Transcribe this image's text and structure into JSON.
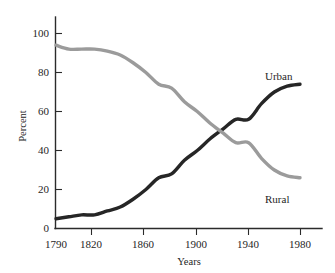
{
  "chart_data": {
    "type": "line",
    "title": "",
    "xlabel": "Years",
    "ylabel": "Percent",
    "xlim": [
      1790,
      1990
    ],
    "ylim": [
      0,
      108
    ],
    "grid": false,
    "legend_position": "inline-right",
    "xticks": [
      1790,
      1820,
      1860,
      1900,
      1940,
      1980
    ],
    "xtick_labels": [
      "1790",
      "1820",
      "1860",
      "1900",
      "1940",
      "1980"
    ],
    "yticks": [
      0,
      20,
      40,
      60,
      80,
      100
    ],
    "ytick_labels": [
      "0",
      "20",
      "40",
      "60",
      "80",
      "100"
    ],
    "x": [
      1790,
      1800,
      1810,
      1820,
      1830,
      1840,
      1850,
      1860,
      1870,
      1880,
      1890,
      1900,
      1910,
      1920,
      1930,
      1940,
      1950,
      1960,
      1970,
      1980
    ],
    "series": [
      {
        "name": "Urban",
        "label": "Urban",
        "color": "#262626",
        "values": [
          5,
          6,
          7,
          7,
          9,
          11,
          15,
          20,
          26,
          28,
          35,
          40,
          46,
          51,
          56,
          56,
          64,
          70,
          73,
          74
        ]
      },
      {
        "name": "Rural",
        "label": "Rural",
        "color": "#9b9b9b",
        "values": [
          94,
          92,
          92,
          92,
          91,
          89,
          85,
          80,
          74,
          72,
          65,
          60,
          54,
          49,
          44,
          44,
          36,
          30,
          27,
          26
        ]
      }
    ],
    "annotations": [
      {
        "text": "Urban",
        "x": 1962,
        "y": 85
      },
      {
        "text": "Rural",
        "x": 1962,
        "y": 16
      }
    ]
  }
}
